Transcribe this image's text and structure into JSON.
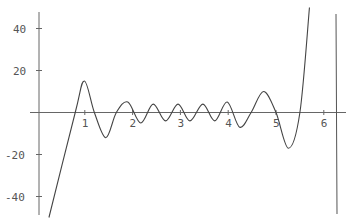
{
  "chart_data": {
    "type": "line",
    "title": "",
    "xlabel": "",
    "ylabel": "",
    "xlim": [
      0,
      6.4
    ],
    "ylim": [
      -50,
      50
    ],
    "grid": false,
    "x_ticks": [
      "1",
      "2",
      "3",
      "4",
      "5",
      "6"
    ],
    "y_ticks": [
      "40",
      "20",
      "-20",
      "-40"
    ],
    "series": [
      {
        "name": "f(x)",
        "x": [
          0.25,
          0.8,
          0.99,
          1.2,
          1.44,
          1.66,
          1.9,
          2.17,
          2.43,
          2.69,
          2.95,
          3.2,
          3.47,
          3.72,
          3.98,
          4.24,
          4.48,
          4.74,
          5.0,
          5.26,
          5.5,
          5.7,
          6.3
        ],
        "y": [
          -50,
          0,
          15,
          0,
          -12,
          0,
          5,
          -5,
          4,
          -4,
          4,
          -4,
          4,
          -4,
          5,
          -7,
          0,
          10,
          0,
          -17,
          0,
          50,
          50
        ]
      }
    ]
  }
}
